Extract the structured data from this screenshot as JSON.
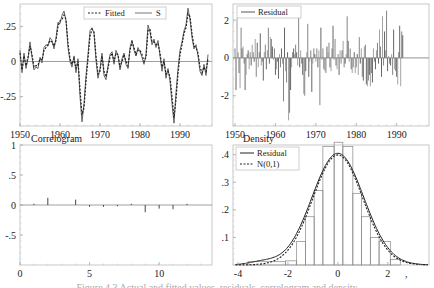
{
  "figure": {
    "caption": "Figure 4.3  Actual and fitted values, residuals, correlogram and density"
  },
  "chart_data": [
    {
      "id": "fitted",
      "type": "line",
      "title": "",
      "xlabel": "",
      "ylabel": "",
      "xlim": [
        1950,
        1998
      ],
      "ylim": [
        -0.46,
        0.41
      ],
      "xticks": [
        1950,
        1960,
        1970,
        1980,
        1990
      ],
      "xtick_labels": [
        "1950",
        "1960",
        "1970",
        "1980",
        "1990"
      ],
      "yticks": [
        0.25,
        0,
        -0.25
      ],
      "ytick_labels": [
        ".25",
        "0",
        "-.25"
      ],
      "legend": [
        "Fitted",
        "S"
      ],
      "legend_position": "top-center",
      "grid": false,
      "x": [
        1950,
        1950.5,
        1951,
        1951.5,
        1952,
        1952.5,
        1953,
        1953.5,
        1954,
        1954.5,
        1955,
        1955.5,
        1956,
        1956.5,
        1957,
        1957.5,
        1958,
        1958.5,
        1959,
        1959.5,
        1960,
        1960.5,
        1961,
        1961.5,
        1962,
        1962.5,
        1963,
        1963.5,
        1964,
        1964.5,
        1965,
        1965.5,
        1966,
        1966.5,
        1967,
        1967.5,
        1968,
        1968.5,
        1969,
        1969.5,
        1970,
        1970.5,
        1971,
        1971.5,
        1972,
        1972.5,
        1973,
        1973.5,
        1974,
        1974.5,
        1975,
        1975.5,
        1976,
        1976.5,
        1977,
        1977.5,
        1978,
        1978.5,
        1979,
        1979.5,
        1980,
        1980.5,
        1981,
        1981.5,
        1982,
        1982.5,
        1983,
        1983.5,
        1984,
        1984.5,
        1985,
        1985.5,
        1986,
        1986.5,
        1987,
        1987.5,
        1988,
        1988.5,
        1989,
        1989.5,
        1990,
        1990.5,
        1991,
        1991.5,
        1992,
        1992.5,
        1993,
        1993.5,
        1994,
        1994.5,
        1995,
        1995.5,
        1996,
        1996.5,
        1997
      ],
      "series": [
        {
          "name": "S",
          "style": "solid",
          "values": [
            0.08,
            -0.08,
            0.06,
            -0.05,
            0.02,
            0.14,
            0.03,
            -0.06,
            -0.04,
            -0.05,
            0.03,
            -0.01,
            0.1,
            0.12,
            0.11,
            0.17,
            0.15,
            0.09,
            0.17,
            0.28,
            0.27,
            0.33,
            0.36,
            0.29,
            0.1,
            0.0,
            -0.04,
            0.04,
            -0.08,
            0.02,
            -0.25,
            -0.43,
            -0.3,
            -0.1,
            0.05,
            0.22,
            0.24,
            0.2,
            0.01,
            -0.12,
            -0.05,
            0.06,
            -0.1,
            -0.13,
            -0.03,
            0.05,
            0.07,
            -0.02,
            0.08,
            0.04,
            -0.06,
            0.02,
            0.06,
            -0.02,
            -0.05,
            0.1,
            0.15,
            0.08,
            0.04,
            0.1,
            0.07,
            0.03,
            -0.02,
            0.05,
            0.26,
            0.21,
            0.12,
            0.16,
            0.1,
            0.15,
            0.04,
            -0.07,
            0.02,
            -0.12,
            -0.05,
            -0.14,
            -0.3,
            -0.44,
            -0.22,
            -0.05,
            0.08,
            0.14,
            0.22,
            0.26,
            0.38,
            0.3,
            0.17,
            0.09,
            0.12,
            0.04,
            -0.07,
            -0.1,
            -0.02,
            -0.1,
            0.05
          ]
        },
        {
          "name": "Fitted",
          "style": "dashed",
          "values": [
            0.06,
            -0.06,
            0.04,
            -0.03,
            0.03,
            0.11,
            0.05,
            -0.04,
            -0.03,
            -0.03,
            0.02,
            0.01,
            0.08,
            0.1,
            0.12,
            0.15,
            0.14,
            0.11,
            0.15,
            0.25,
            0.29,
            0.3,
            0.33,
            0.3,
            0.13,
            0.02,
            -0.02,
            0.02,
            -0.05,
            0.0,
            -0.2,
            -0.38,
            -0.33,
            -0.14,
            0.02,
            0.18,
            0.23,
            0.21,
            0.04,
            -0.09,
            -0.07,
            0.04,
            -0.07,
            -0.11,
            -0.05,
            0.03,
            0.06,
            0.0,
            0.06,
            0.05,
            -0.04,
            0.0,
            0.05,
            0.0,
            -0.03,
            0.08,
            0.14,
            0.1,
            0.05,
            0.08,
            0.08,
            0.05,
            0.0,
            0.03,
            0.22,
            0.23,
            0.14,
            0.14,
            0.12,
            0.13,
            0.06,
            -0.04,
            0.0,
            -0.09,
            -0.07,
            -0.11,
            -0.25,
            -0.4,
            -0.27,
            -0.09,
            0.05,
            0.12,
            0.2,
            0.24,
            0.34,
            0.32,
            0.2,
            0.11,
            0.1,
            0.06,
            -0.04,
            -0.08,
            -0.04,
            -0.07,
            0.02
          ]
        }
      ]
    },
    {
      "id": "residual",
      "type": "bar",
      "title": "",
      "xlim": [
        1949.5,
        1998
      ],
      "ylim": [
        -3.6,
        2.85
      ],
      "xticks": [
        1950,
        1960,
        1970,
        1980,
        1990
      ],
      "xtick_labels": [
        "1950",
        "1960",
        "1970",
        "1980",
        "1990"
      ],
      "yticks": [
        2,
        0,
        -2
      ],
      "ytick_labels": [
        "2",
        "0",
        "-2"
      ],
      "legend": [
        "Residual"
      ],
      "legend_position": "top-left",
      "grid": false,
      "x_start": 1950,
      "x_step": 0.25,
      "values": [
        0.5,
        -1.7,
        2.1,
        0.3,
        -0.8,
        -1.6,
        1.6,
        0.5,
        0.6,
        -0.3,
        -1.7,
        -0.9,
        0.2,
        0.4,
        -0.6,
        0.3,
        -0.4,
        0.7,
        0.3,
        -0.2,
        1.0,
        -1.0,
        0.8,
        -0.5,
        0.3,
        1.3,
        -0.4,
        -0.2,
        -1.2,
        0.3,
        0.7,
        -0.6,
        0.4,
        1.6,
        -0.3,
        1.1,
        1.0,
        0.6,
        -0.1,
        0.5,
        -0.9,
        -0.6,
        -0.2,
        -1.1,
        0.2,
        -0.5,
        0.5,
        -0.3,
        -2.3,
        1.6,
        -0.7,
        -1.3,
        0.3,
        -3.3,
        -2.9,
        -1.7,
        -0.5,
        0.3,
        0.5,
        0.2,
        0.7,
        0.3,
        -0.4,
        2.6,
        -0.5,
        0.4,
        -0.3,
        -0.9,
        -1.9,
        -2.0,
        -0.7,
        0.3,
        1.8,
        -1.0,
        -0.2,
        0.4,
        -1.8,
        -0.3,
        0.5,
        0.2,
        -0.2,
        0.5,
        -0.5,
        0.4,
        -2.5,
        1.6,
        -0.1,
        0.5,
        -0.6,
        -0.7,
        -0.8,
        0.6,
        0.3,
        0.8,
        -0.5,
        -0.7,
        0.5,
        1.7,
        -0.1,
        1.0,
        -0.4,
        -0.6,
        0.2,
        -0.9,
        0.4,
        -0.3,
        0.4,
        0.9,
        -0.5,
        -0.3,
        0.2,
        2.2,
        0.9,
        -0.2,
        0.5,
        -0.6,
        -0.8,
        -0.5,
        0.3,
        -0.8,
        -0.5,
        0.2,
        -0.9,
        1.1,
        -0.3,
        0.5,
        -1.0,
        -1.2,
        0.6,
        0.7,
        -1.4,
        -1.5,
        -1.2,
        -0.9,
        -1.5,
        -0.8,
        -1.3,
        0.5,
        -0.2,
        -0.6,
        0.4,
        0.8,
        -0.3,
        1.5,
        0.6,
        -1.0,
        2.2,
        -0.4,
        1.4,
        0.4,
        2.5,
        -0.7,
        0.1,
        -0.3,
        -0.4,
        0.2,
        -0.9,
        1.5,
        -0.6,
        -0.7,
        -1.0,
        -1.4,
        0.3,
        1.7,
        -1.5,
        1.4,
        1.2
      ]
    },
    {
      "id": "correlogram",
      "type": "bar",
      "title": "Correlogram",
      "xlim": [
        0,
        13.8
      ],
      "ylim": [
        -1,
        1
      ],
      "xticks": [
        0,
        5,
        10
      ],
      "xtick_labels": [
        "0",
        "5",
        "10"
      ],
      "yticks": [
        1,
        0.5,
        0,
        -0.5
      ],
      "ytick_labels": [
        "1",
        ".5",
        "0",
        "-.5"
      ],
      "grid": false,
      "categories": [
        1,
        2,
        3,
        4,
        5,
        6,
        7,
        8,
        9,
        10,
        11,
        12
      ],
      "values": [
        0.02,
        0.12,
        0.0,
        0.09,
        -0.03,
        -0.03,
        -0.02,
        0.02,
        -0.12,
        -0.06,
        -0.07,
        0.02
      ]
    },
    {
      "id": "density",
      "type": "bar",
      "title": "Density",
      "xlim": [
        -4.2,
        3.65
      ],
      "ylim": [
        0,
        0.435
      ],
      "xticks": [
        -4,
        -2,
        0,
        2
      ],
      "xtick_labels": [
        "-4",
        "-2",
        "0",
        "2"
      ],
      "yticks": [
        0.4,
        0.3,
        0.2,
        0.1
      ],
      "ytick_labels": [
        ".4",
        ".3",
        ".2",
        ".1"
      ],
      "legend": [
        "Residual",
        "N(0,1)"
      ],
      "legend_position": "top-left",
      "grid": false,
      "histogram": {
        "bin_edges": [
          -3.6,
          -2.1,
          -1.65,
          -1.3,
          -0.95,
          -0.6,
          -0.15,
          0.2,
          0.6,
          0.95,
          1.3,
          1.65,
          2.1,
          2.5
        ],
        "heights": [
          0.012,
          0.015,
          0.085,
          0.175,
          0.27,
          0.43,
          0.445,
          0.43,
          0.26,
          0.175,
          0.1,
          0.085,
          0.02
        ]
      },
      "series": [
        {
          "name": "Residual",
          "style": "solid",
          "kind": "kernel-density",
          "mean": 0.0,
          "sd": 1.0,
          "peak": 0.405
        },
        {
          "name": "N(0,1)",
          "style": "dashed",
          "kind": "normal",
          "mean": 0.0,
          "sd": 1.0,
          "peak": 0.399
        }
      ]
    }
  ]
}
